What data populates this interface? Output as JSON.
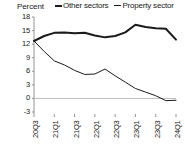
{
  "chart_data": {
    "type": "line",
    "title": "",
    "ylabel": "Percent",
    "xlabel": "",
    "ylim": [
      -3,
      18
    ],
    "yticks": [
      18,
      15,
      12,
      9,
      6,
      3,
      0,
      -3
    ],
    "grid": false,
    "zero_line": true,
    "legend_position": "top",
    "categories": [
      "20Q3",
      "20Q4",
      "21Q1",
      "21Q2",
      "21Q3",
      "21Q4",
      "22Q1",
      "22Q2",
      "22Q3",
      "22Q4",
      "23Q1",
      "23Q2",
      "23Q3",
      "23Q4",
      "24Q1"
    ],
    "tick_labels": [
      "20Q3",
      "21Q1",
      "21Q3",
      "22Q1",
      "22Q3",
      "23Q1",
      "23Q3",
      "24Q1"
    ],
    "series": [
      {
        "name": "Other sectors",
        "color": "#1a1a1a",
        "width": 2,
        "values": [
          12.7,
          13.8,
          14.5,
          14.6,
          14.4,
          14.5,
          13.9,
          13.5,
          13.8,
          14.6,
          16.3,
          15.8,
          15.5,
          15.4,
          13.0
        ]
      },
      {
        "name": "Property sector",
        "color": "#1a1a1a",
        "width": 1,
        "values": [
          12.7,
          10.4,
          8.3,
          7.4,
          6.2,
          5.3,
          5.4,
          6.5,
          5.0,
          3.6,
          2.2,
          1.4,
          0.6,
          -0.5,
          -0.4
        ]
      }
    ]
  },
  "legend": {
    "items": [
      {
        "label": "Other sectors",
        "style": "thick"
      },
      {
        "label": "Property sector",
        "style": "thin"
      }
    ]
  },
  "axes": {
    "y_title": "Percent"
  }
}
